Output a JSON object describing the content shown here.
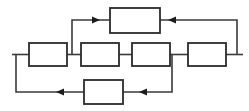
{
  "diagram": {
    "type": "block-diagram",
    "background_color": "#ffffff",
    "block_fill_color": "#ffffff",
    "block_border_color": "#2b2b2b",
    "wire_color": "#3a3a3a",
    "arrow_color": "#1c1c1c",
    "block_count": 6,
    "blocks": [
      {
        "id": "block-top",
        "label": "",
        "row": "top",
        "x": 110,
        "y": 8,
        "w": 50,
        "h": 25
      },
      {
        "id": "block-mid-1",
        "label": "",
        "row": "middle",
        "x": 29,
        "y": 43,
        "w": 38,
        "h": 23
      },
      {
        "id": "block-mid-2",
        "label": "",
        "row": "middle",
        "x": 81,
        "y": 43,
        "w": 38,
        "h": 23
      },
      {
        "id": "block-mid-3",
        "label": "",
        "row": "middle",
        "x": 132,
        "y": 43,
        "w": 38,
        "h": 23
      },
      {
        "id": "block-mid-4",
        "label": "",
        "row": "middle",
        "x": 188,
        "y": 43,
        "w": 38,
        "h": 23
      },
      {
        "id": "block-bottom",
        "label": "",
        "row": "bottom",
        "x": 84,
        "y": 80,
        "w": 39,
        "h": 24
      }
    ],
    "arrows": [
      {
        "id": "arrow-top-in",
        "direction": "right",
        "x": 96,
        "y": 20
      },
      {
        "id": "arrow-top-out",
        "direction": "left",
        "x": 172,
        "y": 20
      },
      {
        "id": "arrow-bottom-left",
        "direction": "left",
        "x": 60,
        "y": 92
      },
      {
        "id": "arrow-bottom-mid",
        "direction": "left",
        "x": 143,
        "y": 92
      }
    ],
    "ports": {
      "input_label": "",
      "output_label": ""
    }
  }
}
